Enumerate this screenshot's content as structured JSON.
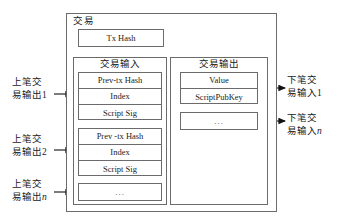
{
  "diagram": {
    "title": "交易",
    "tx_hash_label": "Tx Hash",
    "inputs": {
      "title": "交易输入",
      "groups": [
        {
          "rows": [
            "Prev-tx Hash",
            "Index",
            "Script Sig"
          ]
        },
        {
          "rows": [
            "Prev -tx Hash",
            "Index",
            "Script Sig"
          ]
        }
      ],
      "ellipsis": "..."
    },
    "outputs": {
      "title": "交易输出",
      "groups": [
        {
          "rows": [
            "Value",
            "ScriptPubKey"
          ]
        }
      ],
      "ellipsis": "..."
    },
    "left_labels": [
      {
        "line1": "上笔交",
        "line2": "易输出",
        "index": "1",
        "italic": false
      },
      {
        "line1": "上笔交",
        "line2": "易输出",
        "index": "2",
        "italic": false
      },
      {
        "line1": "上笔交",
        "line2": "易输出",
        "index": "n",
        "italic": true
      }
    ],
    "right_labels": [
      {
        "line1": "下笔交",
        "line2": "易输入",
        "index": "1",
        "italic": false
      },
      {
        "line1": "下笔交",
        "line2": "易输入",
        "index": "n",
        "italic": true
      }
    ],
    "colors": {
      "stroke": "#6b6b6b",
      "text": "#1a1a1a",
      "background": "#ffffff"
    }
  }
}
